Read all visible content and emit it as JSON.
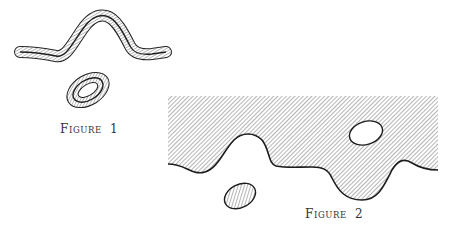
{
  "figures": [
    {
      "id": "figure-1",
      "caption": {
        "first_letter": "F",
        "rest": "igure",
        "number": "1"
      },
      "elements": [
        {
          "type": "hatched-tube-curve",
          "description": "wavy open curve surrounded by a hatched tubular neighborhood"
        },
        {
          "type": "hatched-annulus",
          "description": "closed ellipse surrounded by a hatched ring-shaped neighborhood"
        }
      ]
    },
    {
      "id": "figure-2",
      "caption": {
        "first_letter": "F",
        "rest": "igure",
        "number": "2"
      },
      "elements": [
        {
          "type": "hatched-region",
          "description": "hatched half-plane region bounded below by a wavy curve"
        },
        {
          "type": "hole",
          "description": "white elliptical hole inside the hatched region"
        },
        {
          "type": "hatched-ellipse",
          "description": "small isolated hatched ellipse below the boundary curve"
        }
      ]
    }
  ],
  "colors": {
    "ink": "#222222",
    "hatch": "#555555",
    "background": "#ffffff",
    "caption": "#333333"
  }
}
